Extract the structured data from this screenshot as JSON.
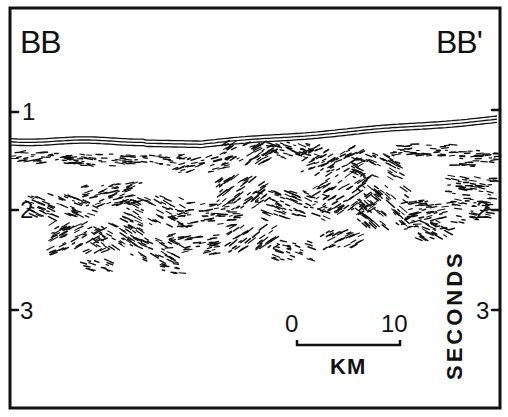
{
  "figure": {
    "type": "seismic reflection profile",
    "left_label": "BB",
    "right_label": "BB'",
    "axis": {
      "unit_label": "SECONDS",
      "left_ticks": [
        {
          "label": "1",
          "y": 112
        },
        {
          "label": "2",
          "y": 210
        },
        {
          "label": "3",
          "y": 310
        }
      ],
      "right_ticks": [
        {
          "label": "",
          "y": 110
        },
        {
          "label": "2",
          "y": 210
        },
        {
          "label": "3",
          "y": 310
        }
      ]
    },
    "scale_bar": {
      "start_label": "0",
      "end_label": "10",
      "unit_label": "KM"
    },
    "colors": {
      "ink": "#111111",
      "background": "#ffffff"
    }
  }
}
